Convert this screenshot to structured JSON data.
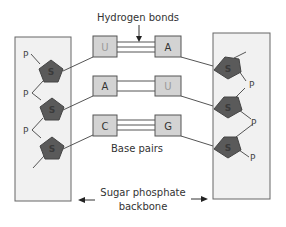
{
  "diagram": {
    "labels": {
      "hydrogen_bonds": "Hydrogen bonds",
      "base_pairs": "Base pairs",
      "backbone_line1": "Sugar phosphate",
      "backbone_line2": "backbone"
    },
    "base_pairs": [
      {
        "left": "U",
        "right": "A",
        "bonds": 3
      },
      {
        "left": "A",
        "right": "U",
        "bonds": 2
      },
      {
        "left": "C",
        "right": "G",
        "bonds": 3
      }
    ],
    "sugar_label": "S",
    "phosphate_label": "P",
    "colors": {
      "backbone_fill": "#f1f1f1",
      "backbone_border": "#666666",
      "base_fill": "#d3d3d3",
      "base_border": "#555555",
      "sugar_fill": "#5a5a5a",
      "text": "#333333",
      "u_text": "#9a9a9a"
    }
  }
}
